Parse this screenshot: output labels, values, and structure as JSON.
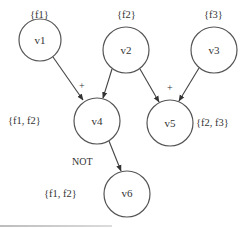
{
  "diagram": {
    "type": "directed-graph",
    "nodes": [
      {
        "id": "v1",
        "label": "v1",
        "set": "{f1}",
        "cx": 40,
        "cy": 40,
        "r": 21,
        "set_x": 30,
        "set_y": 15
      },
      {
        "id": "v2",
        "label": "v2",
        "set": "{f2}",
        "cx": 126,
        "cy": 50,
        "r": 23,
        "set_x": 117,
        "set_y": 15
      },
      {
        "id": "v3",
        "label": "v3",
        "set": "{f3}",
        "cx": 214,
        "cy": 50,
        "r": 23,
        "set_x": 204,
        "set_y": 15
      },
      {
        "id": "v4",
        "label": "v4",
        "set": "{f1, f2}",
        "cx": 97,
        "cy": 121,
        "r": 23,
        "set_x": 8,
        "set_y": 121
      },
      {
        "id": "v5",
        "label": "v5",
        "set": "{f2, f3}",
        "cx": 170,
        "cy": 123,
        "r": 23,
        "set_x": 196,
        "set_y": 123
      },
      {
        "id": "v6",
        "label": "v6",
        "set": "{f1, f2}",
        "cx": 127,
        "cy": 194,
        "r": 23,
        "set_x": 45,
        "set_y": 194
      }
    ],
    "edges": [
      {
        "from": "v1",
        "to": "v4",
        "op": "+"
      },
      {
        "from": "v2",
        "to": "v4",
        "op": "+"
      },
      {
        "from": "v2",
        "to": "v5",
        "op": "+"
      },
      {
        "from": "v3",
        "to": "v5",
        "op": "+"
      },
      {
        "from": "v4",
        "to": "v6",
        "op": "NOT"
      }
    ],
    "operators": [
      {
        "label": "+",
        "x": 82,
        "y": 85
      },
      {
        "label": "+",
        "x": 170,
        "y": 87
      },
      {
        "label": "NOT",
        "x": 79,
        "y": 161
      }
    ],
    "colors": {
      "stroke": "#555555",
      "text": "#333333",
      "background": "#ffffff"
    }
  }
}
